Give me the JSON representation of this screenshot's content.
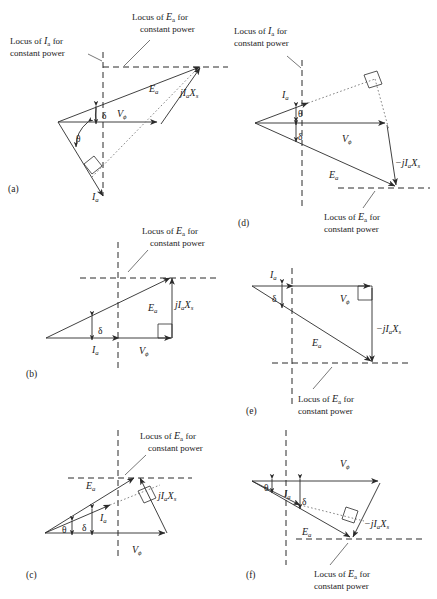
{
  "figure": {
    "type": "phasor-diagram-set",
    "panel_count": 6,
    "caption_partial": "",
    "locus_ia_text_line1": "Locus of I",
    "locus_ia_text_line2": "constant power",
    "locus_ea_text_line1": "Locus of E",
    "locus_ea_text_line2": "constant power",
    "sub_a": "a",
    "word_for": "for"
  },
  "symbols": {
    "Ea": "E",
    "Ea_sub": "a",
    "Ia": "I",
    "Ia_sub": "a",
    "Vphi": "V",
    "Vphi_sub": "ϕ",
    "jIaXs": "jI",
    "jIaXs_mid": "X",
    "jIaXs_sub2": "s",
    "neg_jIaXs": "−jI",
    "delta": "δ",
    "theta": "θ"
  },
  "panels": [
    {
      "id": "a",
      "letter": "(a)",
      "labels": {
        "locus_ia": "Locus of Iₐ for constant power",
        "locus_ea": "Locus of Eₐ for constant power",
        "Ea": "Eₐ",
        "Ia": "Iₐ",
        "Vphi": "Vϕ",
        "jIaXs": "jIₐXₛ",
        "delta": "δ",
        "theta": "θ"
      }
    },
    {
      "id": "b",
      "letter": "(b)",
      "labels": {
        "locus_ea": "Locus of Eₐ for constant power",
        "Ea": "Eₐ",
        "Ia": "Iₐ",
        "Vphi": "Vϕ",
        "jIaXs": "jIₐXₛ",
        "delta": "δ"
      }
    },
    {
      "id": "c",
      "letter": "(c)",
      "labels": {
        "locus_ea": "Locus of Eₐ for constant power",
        "Ea": "Eₐ",
        "Ia": "Iₐ",
        "Vphi": "Vϕ",
        "jIaXs": "jIₐXₛ",
        "delta": "δ",
        "theta": "θ"
      }
    },
    {
      "id": "d",
      "letter": "(d)",
      "labels": {
        "locus_ia": "Locus of Iₐ for constant power",
        "locus_ea": "Locus of Eₐ for constant power",
        "Ea": "Eₐ",
        "Ia": "Iₐ",
        "Vphi": "Vϕ",
        "neg_jIaXs": "−jIₐXₛ",
        "delta": "δ",
        "theta": "θ"
      }
    },
    {
      "id": "e",
      "letter": "(e)",
      "labels": {
        "locus_ea": "Locus of Eₐ for constant power",
        "Ea": "Eₐ",
        "Ia": "Iₐ",
        "Vphi": "Vϕ",
        "neg_jIaXs": "−jIₐXₛ",
        "delta": "δ"
      }
    },
    {
      "id": "f",
      "letter": "(f)",
      "labels": {
        "locus_ea": "Locus of Eₐ for constant power",
        "Ea": "Eₐ",
        "Ia": "Iₐ",
        "Vphi": "Vϕ",
        "neg_jIaXs": "−jIₐXₛ",
        "delta": "δ",
        "theta": "θ"
      }
    }
  ],
  "colors": {
    "ink": "#2b2b2b",
    "background": "#ffffff",
    "dotted": "#777777"
  }
}
